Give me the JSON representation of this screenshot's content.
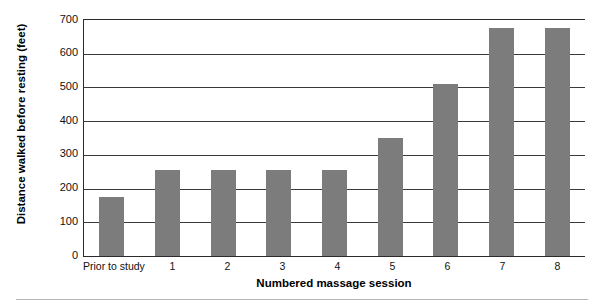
{
  "chart_data": {
    "type": "bar",
    "title": "",
    "xlabel": "Numbered massage session",
    "ylabel": "Distance walked before resting (feet)",
    "categories": [
      "Prior to study",
      "1",
      "2",
      "3",
      "4",
      "5",
      "6",
      "7",
      "8"
    ],
    "values": [
      175,
      255,
      255,
      255,
      255,
      350,
      510,
      675,
      675
    ],
    "yticks": [
      0,
      100,
      200,
      300,
      400,
      500,
      600,
      700
    ],
    "ylim": [
      0,
      700
    ],
    "grid": true,
    "legend": null,
    "series_color": "#7c7c7c",
    "axis_color": "#2b2b2b"
  }
}
